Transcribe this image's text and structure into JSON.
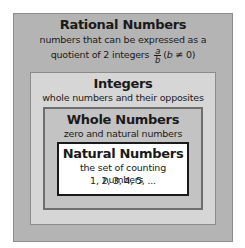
{
  "diagram": {
    "rational": {
      "title": "Rational Numbers",
      "desc_line1": "numbers that can be expressed as a",
      "desc_line2_prefix": "quotient of 2 integers",
      "fraction_num": "a",
      "fraction_den": "b",
      "condition_open": "(",
      "condition_var": "b",
      "condition_rest": " ≠ 0)"
    },
    "integers": {
      "title": "Integers",
      "desc": "whole numbers and their opposites"
    },
    "whole": {
      "title": "Whole Numbers",
      "desc": "zero and natural numbers"
    },
    "natural": {
      "title": "Natural Numbers",
      "desc_line1": "the set of counting numbers",
      "desc_line2": "1, 2, 3, 4, 5, ..."
    },
    "colors": {
      "rational_fill": "#b4b4b4",
      "integers_fill": "#d6d6d6",
      "whole_fill": "#c3c3c3",
      "natural_fill": "#ffffff"
    }
  }
}
